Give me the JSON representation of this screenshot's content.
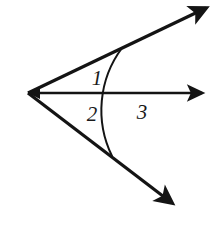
{
  "figure": {
    "kind": "geometry-diagram",
    "background_color": "#ffffff",
    "ink_color": "#141414",
    "canvas": {
      "width": 222,
      "height": 225
    },
    "vertex": {
      "label": "vertex",
      "x": 28,
      "y": 93
    },
    "rays": [
      {
        "name": "upper-ray",
        "from": {
          "x": 28,
          "y": 93
        },
        "to": {
          "x": 212,
          "y": 5
        },
        "angle_degrees": -25.6,
        "arrowhead": "true",
        "stroke_width": 3.2
      },
      {
        "name": "middle-ray",
        "from": {
          "x": 28,
          "y": 93
        },
        "to": {
          "x": 211,
          "y": 93
        },
        "angle_degrees": 0,
        "arrowhead": "true",
        "stroke_width": 2.4
      },
      {
        "name": "lower-ray",
        "from": {
          "x": 28,
          "y": 93
        },
        "to": {
          "x": 179,
          "y": 208
        },
        "angle_degrees": 37.3,
        "arrowhead": "true",
        "stroke_width": 3.2
      }
    ],
    "arc": {
      "name": "angle-arc",
      "radius": 104,
      "start": {
        "x": 122,
        "y": 48
      },
      "end": {
        "x": 112,
        "y": 156
      },
      "crosses_middle_ray_at": {
        "x": 132,
        "y": 93
      },
      "stroke_width": 2.0
    },
    "labels": [
      {
        "id": "1",
        "text": "1",
        "x": 97,
        "y": 78,
        "region": "between-upper-ray-and-middle-ray"
      },
      {
        "id": "2",
        "text": "2",
        "x": 92,
        "y": 114,
        "region": "between-middle-ray-and-lower-ray"
      },
      {
        "id": "3",
        "text": "3",
        "x": 142,
        "y": 112,
        "region": "right-of-arc-below-middle-ray"
      }
    ]
  }
}
